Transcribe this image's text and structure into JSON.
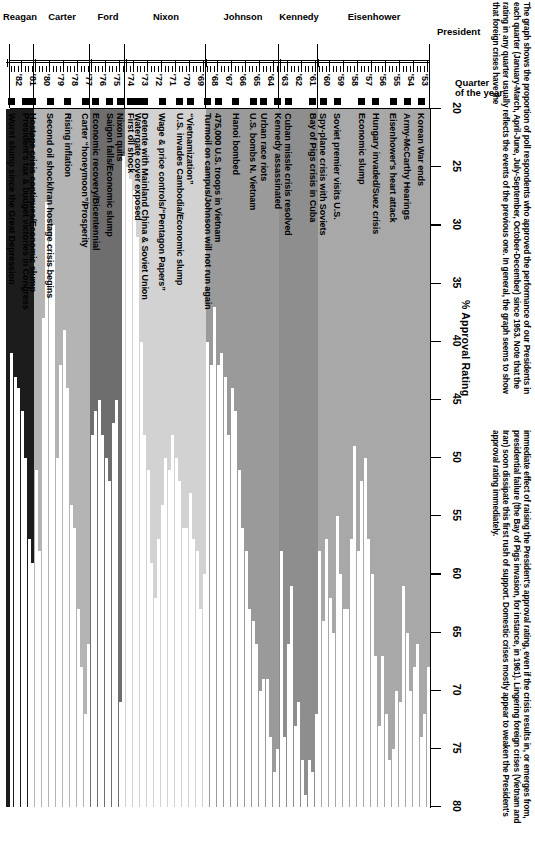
{
  "caption": {
    "left_column": "The graph shows the proportion of poll respondents who approved the performance of our Presidents in each quarter (January-March, April-June, July-September, October-December) since 1953. Note that the rating in any quarter usually reflects the events of the previous one. In general, the graph seems to show that foreign crises have the",
    "right_column": "immediate effect of raising the President's approval rating, even if the crisis results in, or emerges from, presidential failure (the Bay of Pigs invasion, for instance, in 1961). Lingering foreign crises (Vietnam and Iran) soon dissipate this first rush of support. Domestic crises mostly appear to weaken the President's approval rating immediately."
  },
  "headers": {
    "quarter_axis": "Quarter of the year",
    "president_axis": "President",
    "value_axis_title": "% Approval Rating"
  },
  "chart_data": {
    "type": "bar",
    "title": "% Approval Rating",
    "xlabel": "% Approval Rating",
    "ylabel": "Quarter of the year",
    "orientation": "horizontal",
    "xlim": [
      20,
      80
    ],
    "xticks": [
      20,
      25,
      30,
      35,
      40,
      45,
      50,
      55,
      60,
      65,
      70,
      75,
      80
    ],
    "grid": false,
    "legend": "none",
    "presidents": [
      {
        "name": "Eisenhower",
        "start_quarter": 0,
        "end_quarter": 31,
        "color": "#a8a8a8"
      },
      {
        "name": "Kennedy",
        "start_quarter": 32,
        "end_quarter": 42,
        "color": "#8e8e8e"
      },
      {
        "name": "Johnson",
        "start_quarter": 43,
        "end_quarter": 63,
        "color": "#9a9a9a"
      },
      {
        "name": "Nixon",
        "start_quarter": 64,
        "end_quarter": 86,
        "color": "#d2d2d2"
      },
      {
        "name": "Ford",
        "start_quarter": 87,
        "end_quarter": 96,
        "color": "#6e6e6e"
      },
      {
        "name": "Carter",
        "start_quarter": 97,
        "end_quarter": 112,
        "color": "#b4b4b4"
      },
      {
        "name": "Reagan",
        "start_quarter": 113,
        "end_quarter": 120,
        "color": "#1c1c1c"
      }
    ],
    "year_labels": [
      "'53",
      "'54",
      "'55",
      "'56",
      "'57",
      "'58",
      "'59",
      "'60",
      "'61",
      "'62",
      "'63",
      "'64",
      "'65",
      "'66",
      "'67",
      "'68",
      "'69",
      "'70",
      "'71",
      "'72",
      "'73",
      "'74",
      "'75",
      "'76",
      "'77",
      "'78",
      "'79",
      "'80",
      "'81",
      "'82"
    ],
    "values": [
      68,
      72,
      74,
      66,
      68,
      70,
      65,
      61,
      71,
      70,
      75,
      76,
      72,
      67,
      73,
      67,
      60,
      57,
      50,
      52,
      58,
      49,
      57,
      63,
      63,
      60,
      55,
      65,
      62,
      57,
      64,
      58,
      72,
      77,
      76,
      79,
      76,
      71,
      73,
      61,
      66,
      74,
      58,
      75,
      77,
      74,
      69,
      69,
      70,
      66,
      64,
      63,
      58,
      56,
      51,
      46,
      44,
      48,
      43,
      41,
      42,
      37,
      42,
      40,
      60,
      63,
      58,
      57,
      53,
      56,
      56,
      52,
      50,
      48,
      51,
      50,
      54,
      57,
      62,
      59,
      51,
      48,
      40,
      31,
      27,
      26,
      25,
      24,
      71,
      45,
      47,
      52,
      50,
      48,
      45,
      46,
      48,
      66,
      72,
      68,
      63,
      56,
      54,
      44,
      39,
      42,
      50,
      30,
      31,
      28,
      38,
      58,
      51,
      59,
      57,
      50,
      46,
      44,
      43,
      41
    ],
    "events": [
      {
        "quarter": 2,
        "label": "Korean War ends"
      },
      {
        "quarter": 6,
        "label": "Army-McCarthy Hearings"
      },
      {
        "quarter": 10,
        "label": "Eisenhower's heart attack"
      },
      {
        "quarter": 15,
        "label": "Hungary invaded/Suez crisis"
      },
      {
        "quarter": 19,
        "label": "Economic slump"
      },
      {
        "quarter": 26,
        "label": "Soviet premier visits U.S."
      },
      {
        "quarter": 30,
        "label": "Spy-plane crisis with Soviets"
      },
      {
        "quarter": 33,
        "label": "Bay of Pigs crisis in Cuba"
      },
      {
        "quarter": 40,
        "label": "Cuban missle crisis resolved"
      },
      {
        "quarter": 43,
        "label": "Kennedy assassinated"
      },
      {
        "quarter": 47,
        "label": "Urban race riots"
      },
      {
        "quarter": 50,
        "label": "U.S. bombs N. Vietnam"
      },
      {
        "quarter": 55,
        "label": "Hanoi bombed"
      },
      {
        "quarter": 60,
        "label": "475,000 U.S. troops in Vietnam"
      },
      {
        "quarter": 63,
        "label": "Turmoil on campus/Johnson will not run again"
      },
      {
        "quarter": 68,
        "label": "“Vietnamization”"
      },
      {
        "quarter": 71,
        "label": "U.S. invades Cambodia/Economic slump"
      },
      {
        "quarter": 76,
        "label": "Wage & price controls/“Pentagon Papers”"
      },
      {
        "quarter": 81,
        "label": "Detente with Mainland China & Soviet Union"
      },
      {
        "quarter": 83,
        "label": "Watergate cover exposed"
      },
      {
        "quarter": 85,
        "label": "First oil shock"
      },
      {
        "quarter": 88,
        "label": "Nixon quits"
      },
      {
        "quarter": 91,
        "label": "Saigon falls/Economic slump"
      },
      {
        "quarter": 95,
        "label": "Economic recovery/Bicentennial"
      },
      {
        "quarter": 98,
        "label": "Carter “honeymoon”/Prosperity"
      },
      {
        "quarter": 103,
        "label": "Rising inflation"
      },
      {
        "quarter": 108,
        "label": "Second oil shock/Iran hostage crisis begins"
      },
      {
        "quarter": 113,
        "label": "Hostage crisis continues/Economic slump"
      },
      {
        "quarter": 115,
        "label": "President's tax & budget victories in Congress"
      },
      {
        "quarter": 119,
        "label": "Worst slump since the Great Depression"
      }
    ]
  }
}
